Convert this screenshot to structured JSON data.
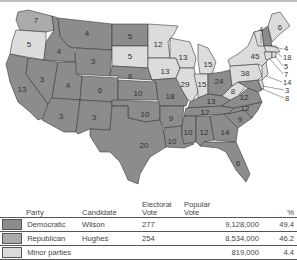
{
  "map": {
    "title": "Presidential election electoral votes by state",
    "colors": {
      "democratic": "#8c8c8c",
      "republican": "#ababab",
      "minor": "#dcdcdc"
    },
    "states": [
      {
        "abbr": "WA",
        "ev": "7",
        "party": "republican"
      },
      {
        "abbr": "OR",
        "ev": "5",
        "party": "minor"
      },
      {
        "abbr": "CA",
        "ev": "13",
        "party": "democratic"
      },
      {
        "abbr": "ID",
        "ev": "4",
        "party": "democratic"
      },
      {
        "abbr": "NV",
        "ev": "3",
        "party": "democratic"
      },
      {
        "abbr": "MT",
        "ev": "4",
        "party": "democratic"
      },
      {
        "abbr": "WY",
        "ev": "3",
        "party": "democratic"
      },
      {
        "abbr": "UT",
        "ev": "4",
        "party": "democratic"
      },
      {
        "abbr": "AZ",
        "ev": "3",
        "party": "democratic"
      },
      {
        "abbr": "CO",
        "ev": "6",
        "party": "democratic"
      },
      {
        "abbr": "NM",
        "ev": "3",
        "party": "democratic"
      },
      {
        "abbr": "ND",
        "ev": "5",
        "party": "democratic"
      },
      {
        "abbr": "SD",
        "ev": "5",
        "party": "minor"
      },
      {
        "abbr": "NE",
        "ev": "8",
        "party": "democratic"
      },
      {
        "abbr": "KS",
        "ev": "10",
        "party": "democratic"
      },
      {
        "abbr": "OK",
        "ev": "10",
        "party": "democratic"
      },
      {
        "abbr": "TX",
        "ev": "20",
        "party": "democratic"
      },
      {
        "abbr": "MN",
        "ev": "12",
        "party": "minor"
      },
      {
        "abbr": "IA",
        "ev": "13",
        "party": "minor"
      },
      {
        "abbr": "MO",
        "ev": "18",
        "party": "democratic"
      },
      {
        "abbr": "AR",
        "ev": "9",
        "party": "democratic"
      },
      {
        "abbr": "LA",
        "ev": "10",
        "party": "democratic"
      },
      {
        "abbr": "WI",
        "ev": "13",
        "party": "minor"
      },
      {
        "abbr": "IL",
        "ev": "29",
        "party": "minor"
      },
      {
        "abbr": "MI",
        "ev": "15",
        "party": "minor"
      },
      {
        "abbr": "IN",
        "ev": "15",
        "party": "minor"
      },
      {
        "abbr": "OH",
        "ev": "24",
        "party": "democratic"
      },
      {
        "abbr": "KY",
        "ev": "13",
        "party": "democratic"
      },
      {
        "abbr": "TN",
        "ev": "12",
        "party": "democratic"
      },
      {
        "abbr": "MS",
        "ev": "10",
        "party": "democratic"
      },
      {
        "abbr": "AL",
        "ev": "12",
        "party": "democratic"
      },
      {
        "abbr": "GA",
        "ev": "14",
        "party": "democratic"
      },
      {
        "abbr": "FL",
        "ev": "6",
        "party": "democratic"
      },
      {
        "abbr": "SC",
        "ev": "9",
        "party": "democratic"
      },
      {
        "abbr": "NC",
        "ev": "12",
        "party": "democratic"
      },
      {
        "abbr": "VA",
        "ev": "12",
        "party": "democratic"
      },
      {
        "abbr": "WV",
        "ev": "8",
        "party": "minor"
      },
      {
        "abbr": "PA",
        "ev": "38",
        "party": "minor"
      },
      {
        "abbr": "NY",
        "ev": "45",
        "party": "minor"
      },
      {
        "abbr": "VT",
        "ev": "4",
        "party": "minor"
      },
      {
        "abbr": "NH",
        "ev": "4",
        "party": "democratic"
      },
      {
        "abbr": "ME",
        "ev": "6",
        "party": "minor"
      },
      {
        "abbr": "MA",
        "ev": "18",
        "party": "minor"
      },
      {
        "abbr": "RI",
        "ev": "5",
        "party": "minor"
      },
      {
        "abbr": "CT",
        "ev": "7",
        "party": "minor"
      },
      {
        "abbr": "NJ",
        "ev": "14",
        "party": "minor"
      },
      {
        "abbr": "DE",
        "ev": "3",
        "party": "minor"
      },
      {
        "abbr": "MD",
        "ev": "8",
        "party": "democratic"
      }
    ]
  },
  "legend": {
    "headers": {
      "party": "Party",
      "candidate": "Candidate",
      "electoral_line1": "Electoral",
      "electoral_line2": "Vote",
      "popular_line1": "Popular",
      "popular_line2": "Vote",
      "percent": "%"
    },
    "rows": [
      {
        "party": "Democratic",
        "candidate": "Wilson",
        "electoral": "277",
        "popular": "9,128,000",
        "percent": "49.4",
        "color": "#8c8c8c"
      },
      {
        "party": "Republican",
        "candidate": "Hughes",
        "electoral": "254",
        "popular": "8,534,000",
        "percent": "46.2",
        "color": "#ababab"
      },
      {
        "party": "Minor parties",
        "candidate": "",
        "electoral": "",
        "popular": "819,000",
        "percent": "4.4",
        "color": "#dcdcdc"
      }
    ]
  }
}
